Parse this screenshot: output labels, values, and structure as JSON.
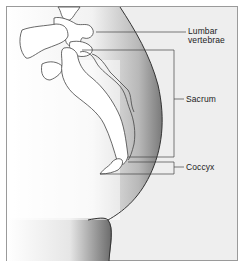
{
  "diagram": {
    "labels": {
      "lumbar_line1": "Lumbar",
      "lumbar_line2": "vertebrae",
      "sacrum": "Sacrum",
      "coccyx": "Coccyx"
    },
    "colors": {
      "background": "#eeeeee",
      "body_fill": "#ffffff",
      "outline": "#333333",
      "frame": "#9a9a9a"
    }
  }
}
